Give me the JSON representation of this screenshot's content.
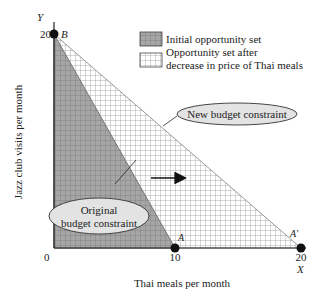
{
  "diagram": {
    "axes": {
      "y_axis_letter": "Y",
      "x_axis_letter": "X",
      "y_label": "Jazz club visits per month",
      "x_label": "Thai meals per month",
      "origin_label": "0",
      "y_tick_20": "20",
      "x_tick_10": "10",
      "x_tick_20": "20"
    },
    "points": {
      "B": "B",
      "A": "A",
      "A_prime": "A'"
    },
    "legend": {
      "initial": "Initial opportunity set",
      "after_line1": "Opportunity set after",
      "after_line2": "decrease in price of Thai meals"
    },
    "callouts": {
      "new_budget": "New budget constraint",
      "original_line1": "Original",
      "original_line2": "budget constraint"
    },
    "colors": {
      "initial_fill": "#a9a9a9",
      "after_fill": "#ffffff",
      "grid_line": "#6a6a6a",
      "callout_fill": "#e3e3e3",
      "axis": "#222222"
    }
  }
}
